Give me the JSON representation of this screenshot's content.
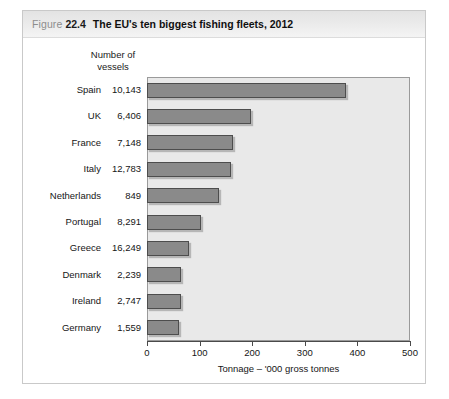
{
  "figure": {
    "label": "Figure",
    "number": "22.4",
    "title": "The EU's ten biggest fishing fleets, 2012"
  },
  "columns": {
    "vessels_header_line1": "Number of",
    "vessels_header_line2": "vessels"
  },
  "chart_data": {
    "type": "bar",
    "orientation": "horizontal",
    "title": "The EU's ten biggest fishing fleets, 2012",
    "xlabel": "Tonnage – '000 gross tonnes",
    "ylabel": "",
    "xlim": [
      0,
      500
    ],
    "xticks": [
      0,
      100,
      200,
      300,
      400,
      500
    ],
    "xtick_labels": [
      "0",
      "100",
      "200",
      "300",
      "400",
      "500"
    ],
    "grid": false,
    "legend": false,
    "categories": [
      "Spain",
      "UK",
      "France",
      "Italy",
      "Netherlands",
      "Portugal",
      "Greece",
      "Denmark",
      "Ireland",
      "Germany"
    ],
    "values": [
      378,
      198,
      164,
      160,
      137,
      103,
      80,
      65,
      65,
      61
    ],
    "series": [
      {
        "name": "Tonnage – '000 gross tonnes",
        "values": [
          378,
          198,
          164,
          160,
          137,
          103,
          80,
          65,
          65,
          61
        ]
      }
    ],
    "vessel_counts": [
      "10,143",
      "6,406",
      "7,148",
      "12,783",
      "849",
      "8,291",
      "16,249",
      "2,239",
      "2,747",
      "1,559"
    ],
    "bar_color": "#8a8a8a",
    "plot_background": "#e9e9e9"
  }
}
